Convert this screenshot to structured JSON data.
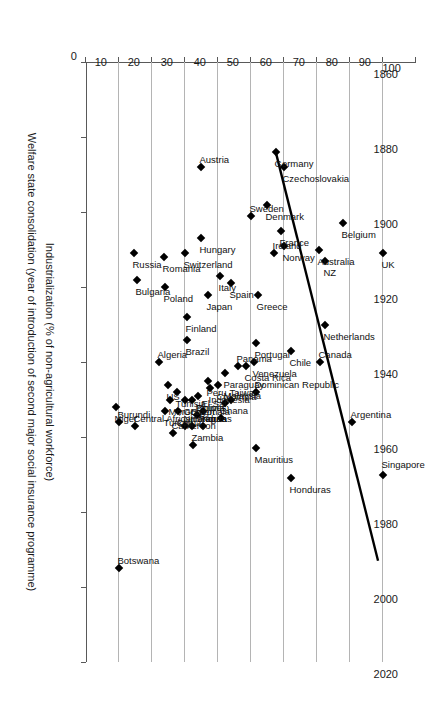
{
  "chart_data": {
    "type": "scatter",
    "title": "",
    "xlabel": "Welfare state consolidation (year of introduction of second major social insurance programme)",
    "ylabel": "Industrialization (% of non-agricultural workforce)",
    "xlim": [
      1860,
      2020
    ],
    "ylim": [
      0,
      100
    ],
    "xticks": [
      1860,
      1880,
      1900,
      1920,
      1940,
      1960,
      1980,
      2000,
      2020
    ],
    "yticks": [
      0,
      10,
      20,
      30,
      40,
      50,
      60,
      70,
      80,
      90,
      100
    ],
    "grid": "horizontal-only-at-y-ticks",
    "legend": "none",
    "marker": "filled-diamond",
    "trendline": {
      "x0": 1884,
      "y0": 57.5,
      "x1": 1993,
      "y1": 88.5,
      "style": "solid-black"
    },
    "points": [
      {
        "label": "Singapore",
        "x": 1970,
        "y": 90.0,
        "lx": -4,
        "ly": -11
      },
      {
        "label": "UK",
        "x": 1911,
        "y": 90.0,
        "lx": -4,
        "ly": 11
      },
      {
        "label": "Argentina",
        "x": 1956,
        "y": 80.5,
        "lx": -4,
        "ly": -8
      },
      {
        "label": "Belgium",
        "x": 1903,
        "y": 78.0,
        "lx": -4,
        "ly": 11
      },
      {
        "label": "NZ",
        "x": 1913,
        "y": 72.5,
        "lx": -4,
        "ly": 11
      },
      {
        "label": "Australia",
        "x": 1910,
        "y": 70.5,
        "lx": -4,
        "ly": 11
      },
      {
        "label": "Netherlands",
        "x": 1930,
        "y": 72.5,
        "lx": -4,
        "ly": 11
      },
      {
        "label": "Canada",
        "x": 1940,
        "y": 71.0,
        "lx": -4,
        "ly": -8
      },
      {
        "label": "Chile",
        "x": 1937,
        "y": 62.0,
        "lx": -4,
        "ly": 11
      },
      {
        "label": "Honduras",
        "x": 1971,
        "y": 62.0,
        "lx": -4,
        "ly": 11
      },
      {
        "label": "Czechoslovakia",
        "x": 1888,
        "y": 60.0,
        "lx": -4,
        "ly": 11
      },
      {
        "label": "Norway",
        "x": 1909,
        "y": 60.0,
        "lx": -4,
        "ly": 11
      },
      {
        "label": "France",
        "x": 1905,
        "y": 59.0,
        "lx": -4,
        "ly": 11
      },
      {
        "label": "Ireland",
        "x": 1911,
        "y": 57.0,
        "lx": -4,
        "ly": -8
      },
      {
        "label": "Germany",
        "x": 1884,
        "y": 57.5,
        "lx": -4,
        "ly": 11
      },
      {
        "label": "Denmark",
        "x": 1898,
        "y": 55.0,
        "lx": -4,
        "ly": 11
      },
      {
        "label": "Greece",
        "x": 1922,
        "y": 52.0,
        "lx": -4,
        "ly": 11
      },
      {
        "label": "Portugal",
        "x": 1935,
        "y": 51.5,
        "lx": -4,
        "ly": 11
      },
      {
        "label": "Venezuela",
        "x": 1940,
        "y": 51.0,
        "lx": -4,
        "ly": 11
      },
      {
        "label": "Sweden",
        "x": 1901,
        "y": 50.0,
        "lx": -4,
        "ly": -8
      },
      {
        "label": "Mauritius",
        "x": 1963,
        "y": 51.5,
        "lx": -4,
        "ly": 11
      },
      {
        "label": "Dominican Republic",
        "x": 1948,
        "y": 51.5,
        "lx": -4,
        "ly": -8
      },
      {
        "label": "Costa Rica",
        "x": 1941,
        "y": 48.5,
        "lx": -4,
        "ly": 11
      },
      {
        "label": "Panama",
        "x": 1941,
        "y": 46.0,
        "lx": -4,
        "ly": -8
      },
      {
        "label": "Spain",
        "x": 1919,
        "y": 44.0,
        "lx": -4,
        "ly": 11
      },
      {
        "label": "Italy",
        "x": 1917,
        "y": 40.5,
        "lx": -4,
        "ly": 11
      },
      {
        "label": "Taiwan",
        "x": 1950,
        "y": 44.0,
        "lx": -4,
        "ly": -8
      },
      {
        "label": "Paraguay",
        "x": 1943,
        "y": 42.0,
        "lx": -4,
        "ly": 11
      },
      {
        "label": "Colombia",
        "x": 1946,
        "y": 40.0,
        "lx": -4,
        "ly": 11
      },
      {
        "label": "Malaysia",
        "x": 1951,
        "y": 42.0,
        "lx": -4,
        "ly": -8
      },
      {
        "label": "Ghana",
        "x": 1955,
        "y": 41.0,
        "lx": -4,
        "ly": -8
      },
      {
        "label": "Indonesia",
        "x": 1947,
        "y": 37.5,
        "lx": -4,
        "ly": 11
      },
      {
        "label": "Japan",
        "x": 1922,
        "y": 37.0,
        "lx": -4,
        "ly": 11
      },
      {
        "label": "Hungary",
        "x": 1907,
        "y": 35.0,
        "lx": -4,
        "ly": 11
      },
      {
        "label": "Austria",
        "x": 1888,
        "y": 35.0,
        "lx": -4,
        "ly": -8
      },
      {
        "label": "Peru",
        "x": 1945,
        "y": 37.0,
        "lx": -4,
        "ly": 11
      },
      {
        "label": "Brazil",
        "x": 1934,
        "y": 30.5,
        "lx": -4,
        "ly": 11
      },
      {
        "label": "Finland",
        "x": 1928,
        "y": 30.5,
        "lx": -4,
        "ly": 11
      },
      {
        "label": "Switzerland",
        "x": 1911,
        "y": 30.0,
        "lx": -4,
        "ly": 11
      },
      {
        "label": "Bolivia",
        "x": 1949,
        "y": 34.0,
        "lx": -4,
        "ly": 11
      },
      {
        "label": "El Sal.",
        "x": 1953,
        "y": 35.5,
        "lx": -4,
        "ly": -8
      },
      {
        "label": "Egypt",
        "x": 1950,
        "y": 32.0,
        "lx": -4,
        "ly": 11
      },
      {
        "label": "P'pines",
        "x": 1954,
        "y": 33.5,
        "lx": -4,
        "ly": -8
      },
      {
        "label": "Korea",
        "x": 1957,
        "y": 35.5,
        "lx": -4,
        "ly": -8
      },
      {
        "label": "Guatemala",
        "x": 1950,
        "y": 30.0,
        "lx": -4,
        "ly": 11
      },
      {
        "label": "Honduras",
        "x": 1957,
        "y": 32.0,
        "lx": -4,
        "ly": -8
      },
      {
        "label": "Tunisia",
        "x": 1948,
        "y": 27.5,
        "lx": -4,
        "ly": 11
      },
      {
        "label": "China",
        "x": 1953,
        "y": 28.0,
        "lx": -4,
        "ly": 11
      },
      {
        "label": "Nicaragua",
        "x": 1957,
        "y": 30.0,
        "lx": -4,
        "ly": -8
      },
      {
        "label": "Zambia",
        "x": 1962,
        "y": 32.5,
        "lx": -4,
        "ly": -8
      },
      {
        "label": "US",
        "x": 1946,
        "y": 25.0,
        "lx": -4,
        "ly": 11
      },
      {
        "label": "Morocco",
        "x": 1950,
        "y": 25.5,
        "lx": -4,
        "ly": 11
      },
      {
        "label": "Turkey",
        "x": 1953,
        "y": 24.0,
        "lx": -4,
        "ly": 11
      },
      {
        "label": "Cameroon",
        "x": 1959,
        "y": 26.5,
        "lx": -4,
        "ly": -8
      },
      {
        "label": "Poland",
        "x": 1920,
        "y": 24.0,
        "lx": -4,
        "ly": 11
      },
      {
        "label": "Romania",
        "x": 1912,
        "y": 23.5,
        "lx": -4,
        "ly": 11
      },
      {
        "label": "Algeria",
        "x": 1940,
        "y": 22.0,
        "lx": -4,
        "ly": -8
      },
      {
        "label": "Bulgaria",
        "x": 1918,
        "y": 15.5,
        "lx": -4,
        "ly": 11
      },
      {
        "label": "Russia",
        "x": 1911,
        "y": 14.5,
        "lx": -4,
        "ly": 11
      },
      {
        "label": "Central African Rep.",
        "x": 1957,
        "y": 15.0,
        "lx": -4,
        "ly": -8
      },
      {
        "label": "Niger",
        "x": 1952,
        "y": 9.0,
        "lx": -4,
        "ly": 11
      },
      {
        "label": "Burundi",
        "x": 1956,
        "y": 10.0,
        "lx": -4,
        "ly": -8
      },
      {
        "label": "Botswana",
        "x": 1995,
        "y": 10.0,
        "lx": -4,
        "ly": -8
      }
    ]
  },
  "axes": {
    "x_title": "Welfare state consolidation (year of introduction of second major social insurance programme)",
    "y_title": "Industrialization (% of non-agricultural workforce)"
  }
}
